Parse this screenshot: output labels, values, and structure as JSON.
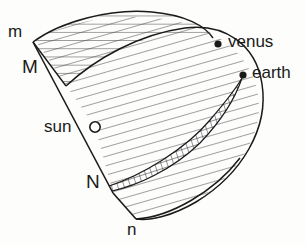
{
  "figure": {
    "type": "astronomical-diagram",
    "background_color": "#fdfdfc",
    "ink_color": "#1a1a1a",
    "hatch_color": "#4a4a4a"
  },
  "labels": {
    "m": "m",
    "M": "M",
    "sun": "sun",
    "N": "N",
    "n": "n",
    "venus": "venus",
    "earth": "earth"
  },
  "markers": [
    {
      "name": "sun",
      "style": "open-circle",
      "x": 95,
      "y": 127
    },
    {
      "name": "venus",
      "style": "filled-circle",
      "x": 218,
      "y": 44
    },
    {
      "name": "earth",
      "style": "filled-circle",
      "x": 243,
      "y": 75
    }
  ],
  "regions": [
    {
      "name": "upper-hatched-lens",
      "fill": "horizontal-hatch"
    },
    {
      "name": "main-hatched-lens",
      "fill": "horizontal-hatch"
    },
    {
      "name": "crescent-band",
      "fill": "cross-hatch"
    }
  ],
  "lines": [
    {
      "name": "sight-line-M-to-N",
      "from": "M",
      "through": "sun",
      "to": "N"
    }
  ]
}
